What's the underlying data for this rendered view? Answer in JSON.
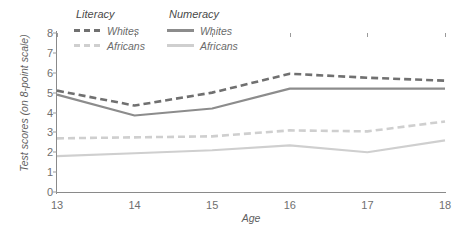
{
  "chart_data": {
    "type": "line",
    "title": "",
    "xlabel": "Age",
    "ylabel": "Test scores (on 8-point scale)",
    "categories": [
      13,
      14,
      15,
      16,
      17,
      18
    ],
    "x": [
      13,
      14,
      15,
      16,
      17,
      18
    ],
    "xlim": [
      13,
      18
    ],
    "ylim": [
      0,
      8
    ],
    "ytick_labels": [
      "0",
      "1",
      "2",
      "3",
      "4",
      "5",
      "6",
      "7",
      "8"
    ],
    "xtick_labels": [
      "13",
      "14",
      "15",
      "16",
      "17",
      "18"
    ],
    "grid": false,
    "legend_position": "top-left-inside",
    "series": [
      {
        "name": "Literacy Whites",
        "group": "Literacy",
        "label": "Whites",
        "style": "dashed",
        "color": "#707070",
        "values": [
          5.1,
          4.35,
          5.0,
          5.95,
          5.75,
          5.6
        ]
      },
      {
        "name": "Literacy Africans",
        "group": "Literacy",
        "label": "Africans",
        "style": "dashed",
        "color": "#cfcfcf",
        "values": [
          2.7,
          2.75,
          2.8,
          3.1,
          3.05,
          3.55
        ]
      },
      {
        "name": "Numeracy Whites",
        "group": "Numeracy",
        "label": "Whites",
        "style": "solid",
        "color": "#8c8c8c",
        "values": [
          4.9,
          3.85,
          4.2,
          5.2,
          5.2,
          5.2
        ]
      },
      {
        "name": "Numeracy Africans",
        "group": "Numeracy",
        "label": "Africans",
        "style": "solid",
        "color": "#cfcfcf",
        "values": [
          1.8,
          1.95,
          2.1,
          2.35,
          2.0,
          2.6
        ]
      }
    ]
  },
  "legend": {
    "groups": [
      {
        "title": "Literacy",
        "entries": [
          {
            "label": "Whites",
            "swatch": "dash-dark"
          },
          {
            "label": "Africans",
            "swatch": "dash-light"
          }
        ]
      },
      {
        "title": "Numeracy",
        "entries": [
          {
            "label": "Whites",
            "swatch": "solid-dark"
          },
          {
            "label": "Africans",
            "swatch": "solid-light"
          }
        ]
      }
    ]
  }
}
